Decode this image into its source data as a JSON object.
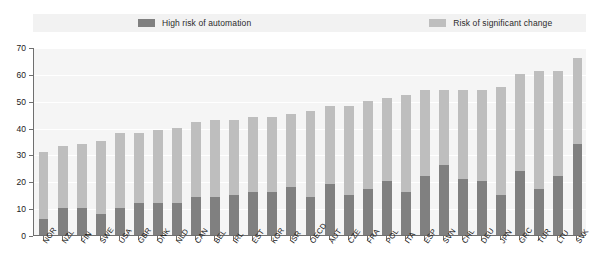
{
  "legend": {
    "items": [
      {
        "label": "High risk of automation",
        "color": "#808080",
        "icon": "legend-swatch-dark"
      },
      {
        "label": "Risk of significant change",
        "color": "#bebebe",
        "icon": "legend-swatch-light"
      }
    ]
  },
  "axis": {
    "y_ticks": [
      "0",
      "10",
      "20",
      "30",
      "40",
      "50",
      "60",
      "70"
    ]
  },
  "chart_data": {
    "type": "bar",
    "stacked": true,
    "title": "",
    "subtitle": "",
    "xlabel": "",
    "ylabel": "",
    "ylim": [
      0,
      70
    ],
    "ytick_step": 10,
    "grid": true,
    "legend_position": "top",
    "categories": [
      "NOR",
      "NZL",
      "FIN",
      "SWE",
      "USA",
      "GBR",
      "DNK",
      "NLD",
      "CAN",
      "BEL",
      "IRL",
      "EST",
      "KOR",
      "ISR",
      "OECD",
      "AUT",
      "CZE",
      "FRA",
      "POL",
      "ITA",
      "ESP",
      "SVN",
      "CHL",
      "DEU",
      "JPN",
      "GRC",
      "TUR",
      "LTU",
      "SVK"
    ],
    "series": [
      {
        "name": "High risk of automation",
        "color": "#808080",
        "values": [
          6,
          10,
          10,
          8,
          10,
          12,
          12,
          12,
          14,
          14,
          15,
          16,
          16,
          18,
          14,
          19,
          15,
          17,
          20,
          16,
          22,
          26,
          21,
          20,
          15,
          24,
          17,
          22,
          34
        ]
      },
      {
        "name": "Risk of significant change",
        "color": "#bebebe",
        "values": [
          25,
          23,
          24,
          27,
          28,
          26,
          27,
          28,
          28,
          29,
          28,
          28,
          28,
          27,
          32,
          29,
          33,
          33,
          31,
          36,
          32,
          28,
          33,
          34,
          40,
          36,
          44,
          39,
          32
        ]
      }
    ],
    "totals": [
      31,
      33,
      34,
      35,
      38,
      38,
      39,
      40,
      42,
      43,
      43,
      44,
      44,
      45,
      46,
      48,
      48,
      50,
      51,
      52,
      54,
      54,
      54,
      54,
      55,
      60,
      61,
      61,
      66
    ]
  }
}
